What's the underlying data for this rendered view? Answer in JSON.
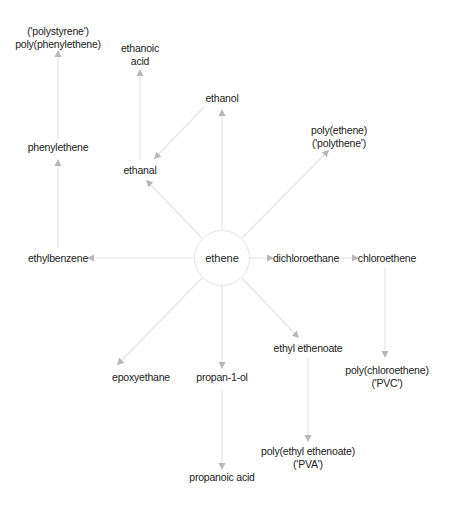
{
  "diagram": {
    "colors": {
      "edge": "#e4e4e4",
      "arrowhead": "#b8b8b8",
      "text": "#222222",
      "circle": "#e3e3e3"
    },
    "center": {
      "id": "ethene",
      "label": "ethene"
    },
    "nodes": {
      "polystyrene": {
        "line1": "('polystyrene')",
        "line2": "poly(phenylethene)"
      },
      "ethanoic_acid": {
        "line1": "ethanoic",
        "line2": "acid"
      },
      "ethanol": {
        "label": "ethanol"
      },
      "phenylethene": {
        "label": "phenylethene"
      },
      "ethanal": {
        "label": "ethanal"
      },
      "polythene": {
        "line1": "poly(ethene)",
        "line2": "('polythene')"
      },
      "ethylbenzene": {
        "label": "ethylbenzene"
      },
      "dichloroethane": {
        "label": "dichloroethane"
      },
      "chloroethene": {
        "label": "chloroethene"
      },
      "epoxyethane": {
        "label": "epoxyethane"
      },
      "propan_1_ol": {
        "label": "propan-1-ol"
      },
      "ethyl_ethenoate": {
        "label": "ethyl ethenoate"
      },
      "pvc": {
        "line1": "poly(chloroethene)",
        "line2": "('PVC')"
      },
      "pva": {
        "line1": "poly(ethyl ethenoate)",
        "line2": "('PVA')"
      },
      "propanoic_acid": {
        "label": "propanoic acid"
      }
    },
    "edges": [
      {
        "from": "ethene",
        "to": "ethanol"
      },
      {
        "from": "ethene",
        "to": "ethanal"
      },
      {
        "from": "ethanol",
        "to": "ethanal"
      },
      {
        "from": "ethanal",
        "to": "ethanoic acid"
      },
      {
        "from": "ethene",
        "to": "poly(ethene)"
      },
      {
        "from": "ethene",
        "to": "ethylbenzene"
      },
      {
        "from": "ethylbenzene",
        "to": "phenylethene"
      },
      {
        "from": "phenylethene",
        "to": "poly(phenylethene)"
      },
      {
        "from": "ethene",
        "to": "dichloroethane"
      },
      {
        "from": "dichloroethane",
        "to": "chloroethene"
      },
      {
        "from": "chloroethene",
        "to": "poly(chloroethene)"
      },
      {
        "from": "ethene",
        "to": "epoxyethane"
      },
      {
        "from": "ethene",
        "to": "propan-1-ol"
      },
      {
        "from": "propan-1-ol",
        "to": "propanoic acid"
      },
      {
        "from": "ethene",
        "to": "ethyl ethenoate"
      },
      {
        "from": "ethyl ethenoate",
        "to": "poly(ethyl ethenoate)"
      }
    ]
  }
}
